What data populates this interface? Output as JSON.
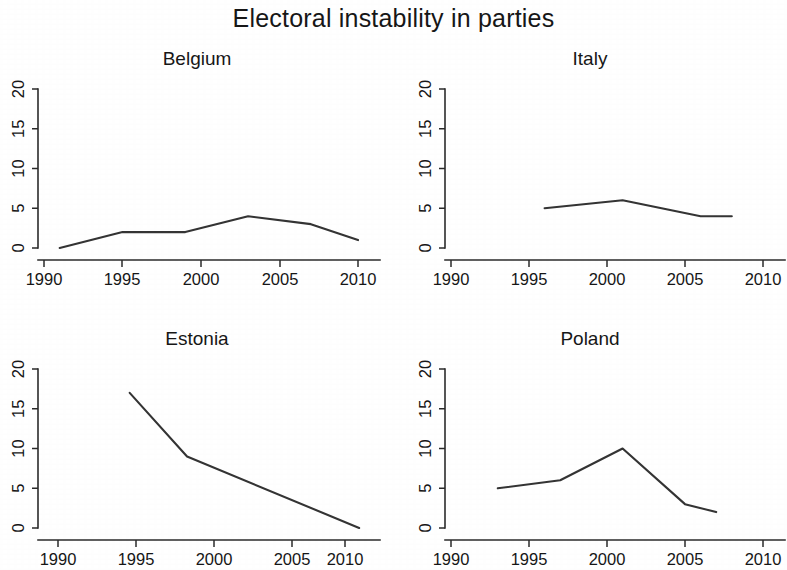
{
  "chart_data": {
    "type": "line",
    "title": "Electoral instability in parties",
    "xlabel": "",
    "ylabel": "",
    "layout": {
      "rows": 2,
      "cols": 2,
      "grid": false,
      "legend": "none",
      "shared_y_ticks": [
        0,
        5,
        10,
        15,
        20
      ],
      "y_tick_labels": [
        "0",
        "5",
        "10",
        "15",
        "20"
      ],
      "ylim": [
        0,
        21
      ],
      "y_label_rotation_deg": -90
    },
    "panels": [
      {
        "name": "Belgium",
        "xlim": [
          1988,
          2012
        ],
        "x_ticks": [
          1990,
          1995,
          2000,
          2005,
          2010
        ],
        "x_tick_labels": [
          "1990",
          "1995",
          "2000",
          "2005",
          "2010"
        ],
        "x": [
          1991,
          1995,
          1999,
          2003,
          2007,
          2010
        ],
        "y": [
          0,
          2,
          2,
          4,
          3,
          1
        ]
      },
      {
        "name": "Italy",
        "xlim": [
          1988,
          2012
        ],
        "x_ticks": [
          1990,
          1995,
          2000,
          2005,
          2010
        ],
        "x_tick_labels": [
          "1990",
          "1995",
          "2000",
          "2005",
          "2010"
        ],
        "x": [
          1996,
          2001,
          2006,
          2008
        ],
        "y": [
          5,
          6,
          4,
          4
        ]
      },
      {
        "name": "Estonia",
        "xlim": [
          1987,
          2013
        ],
        "x_ticks": [
          1990,
          1995,
          2000,
          2005,
          2010
        ],
        "x_tick_labels": [
          "1990",
          "1995",
          "2000",
          "2005",
          "2010"
        ],
        "x": [
          1995,
          1999,
          2011
        ],
        "y": [
          17,
          9,
          0
        ]
      },
      {
        "name": "Poland",
        "xlim": [
          1988,
          2012
        ],
        "x_ticks": [
          1990,
          1995,
          2000,
          2005,
          2010
        ],
        "x_tick_labels": [
          "1990",
          "1995",
          "2000",
          "2005",
          "2010"
        ],
        "x": [
          1993,
          1997,
          2001,
          2005,
          2007
        ],
        "y": [
          5,
          6,
          10,
          3,
          2
        ]
      }
    ],
    "colors": {
      "line": "#343434",
      "axis": "#2b2b2b",
      "text": "#171717",
      "background": "#ffffff"
    }
  }
}
